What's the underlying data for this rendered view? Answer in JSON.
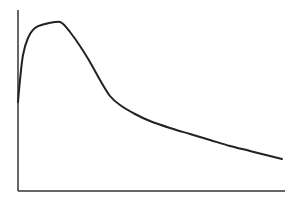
{
  "chart_data": {
    "type": "line",
    "title": "",
    "xlabel": "",
    "ylabel": "",
    "grid": false,
    "legend": null,
    "axes": {
      "origin_px": [
        18,
        191
      ],
      "x_end_px": [
        285,
        191
      ],
      "y_end_px": [
        18,
        10
      ],
      "color": "#333333"
    },
    "series": [
      {
        "name": "curve",
        "color": "#222222",
        "description": "Rapid rise from a nonzero start to an early peak, then steep decline flattening into a long, gradually decreasing tail",
        "points_px": [
          [
            18,
            102
          ],
          [
            20,
            80
          ],
          [
            23,
            55
          ],
          [
            28,
            38
          ],
          [
            35,
            28
          ],
          [
            45,
            24
          ],
          [
            55,
            22
          ],
          [
            62,
            23
          ],
          [
            70,
            32
          ],
          [
            80,
            46
          ],
          [
            90,
            62
          ],
          [
            100,
            80
          ],
          [
            110,
            96
          ],
          [
            120,
            105
          ],
          [
            135,
            114
          ],
          [
            150,
            121
          ],
          [
            170,
            128
          ],
          [
            190,
            134
          ],
          [
            210,
            140
          ],
          [
            230,
            146
          ],
          [
            250,
            151
          ],
          [
            270,
            156
          ],
          [
            282,
            159
          ]
        ],
        "relative_values": {
          "x": [
            0,
            0.01,
            0.02,
            0.04,
            0.06,
            0.1,
            0.14,
            0.16,
            0.19,
            0.23,
            0.27,
            0.31,
            0.34,
            0.38,
            0.44,
            0.49,
            0.57,
            0.64,
            0.72,
            0.79,
            0.87,
            0.94,
            0.99
          ],
          "y": [
            0.49,
            0.61,
            0.75,
            0.85,
            0.9,
            0.92,
            0.93,
            0.93,
            0.88,
            0.8,
            0.71,
            0.61,
            0.52,
            0.47,
            0.42,
            0.38,
            0.35,
            0.31,
            0.28,
            0.25,
            0.22,
            0.19,
            0.18
          ]
        }
      }
    ]
  }
}
